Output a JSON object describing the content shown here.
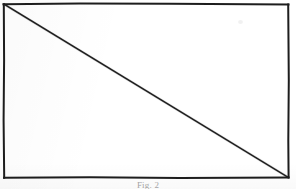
{
  "document": {
    "kind": "scanned-figure",
    "page_background": "#ffffff",
    "ink_color": "#1d1d1d"
  },
  "figure": {
    "caption": "Fig. 2",
    "frame": {
      "name": "rectangle-outline",
      "x": 3.5,
      "y": 3.5,
      "width": 285,
      "height": 174,
      "stroke_width": 2,
      "stroke_color": "#1d1d1d"
    },
    "diagonal": {
      "name": "diagonal-line",
      "x1": 4,
      "y1": 4,
      "x2": 288,
      "y2": 177,
      "stroke_width": 1.5,
      "stroke_color": "#242424",
      "direction": "top-left-to-bottom-right"
    },
    "artifacts": [
      {
        "name": "scan-speck",
        "x": 238,
        "y": 20
      }
    ]
  }
}
